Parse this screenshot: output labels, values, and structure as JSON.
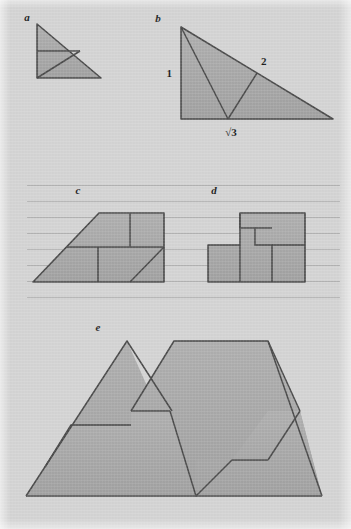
{
  "plate": {
    "width": 351,
    "height": 529,
    "background_color": "#d5d5d5",
    "fill_color": "#a9a9a9",
    "stroke_color": "#4a4a4a",
    "rule_color": "#b3b3b3",
    "paper_texture": true
  },
  "figures": [
    {
      "id": "a",
      "label": "a",
      "label_x": 27,
      "label_y": 21,
      "description": "small right triangle dissected by one internal cut",
      "outline": "37,24 37,78 101,78",
      "cuts": [
        "37,51 80,51",
        "80,51 37,78"
      ]
    },
    {
      "id": "b",
      "label": "b",
      "label_x": 158,
      "label_y": 22,
      "description": "30-60-90 triangle with zigzag dissection cuts",
      "outline": "181,27 181,119 333,119",
      "cuts": [
        "181,27 228,119",
        "228,119 257,73"
      ],
      "dimensions": [
        {
          "name": "leg-short",
          "text": "1",
          "x": 172,
          "y": 77,
          "anchor": "end"
        },
        {
          "name": "hypotenuse",
          "text": "2",
          "x": 261,
          "y": 65,
          "anchor": "start"
        },
        {
          "name": "leg-long",
          "text": "√3",
          "x": 231,
          "y": 136,
          "anchor": "middle"
        }
      ]
    },
    {
      "id": "c",
      "label": "c",
      "label_x": 78,
      "label_y": 194,
      "description": "trapezoid dissected into four pieces",
      "outline": "33,282 99,213 164,213 164,282",
      "cuts": [
        "66,247 164,247",
        "130,213 130,247",
        "98,247 98,282",
        "164,247 130,282"
      ]
    },
    {
      "id": "d",
      "label": "d",
      "label_x": 214,
      "label_y": 194,
      "description": "rectangle dissected into interlocking notched pieces",
      "outline": "208,245 240,245 240,213 305,213 305,282 208,282",
      "cuts": [
        "240,245 240,282",
        "240,213 240,228 255,228 255,245 272,245 272,282",
        "272,245 305,245",
        "255,228 272,228"
      ]
    },
    {
      "id": "e",
      "label": "e",
      "label_x": 98,
      "label_y": 331,
      "description": "large mountain zigzag composite of triangle and trapezoid",
      "outline": "26,496 127,341 170,411 225,411 228,411 131,411 174,341 268,341 300,411 282,411 322,496",
      "cuts": []
    }
  ],
  "ruled_lines": {
    "x_start": 27,
    "x_end": 340,
    "spacing": 16,
    "y_values": [
      185,
      201,
      217,
      233,
      249,
      265,
      281,
      297
    ]
  }
}
